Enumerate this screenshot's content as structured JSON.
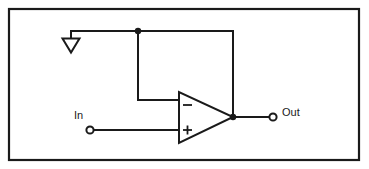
{
  "figure": {
    "kind": "schematic-diagram",
    "background_color": "#ffffff",
    "line_color": "#1a1a1a",
    "frame": {
      "name": "figure-border",
      "x": 8,
      "y": 8,
      "width": 352,
      "height": 153
    }
  },
  "labels": {
    "input": "In",
    "output": "Out"
  },
  "components": {
    "opamp": {
      "name": "operational-amplifier",
      "shape": "triangle",
      "inverting_input_mark": "minus",
      "noninverting_input_mark": "plus",
      "apex_x": 233,
      "apex_y": 117,
      "left_x": 179,
      "top_y": 92,
      "bottom_y": 143
    },
    "ground_arrow": {
      "name": "ground-arrowhead",
      "shape": "open-downward-triangle",
      "tip_x": 71,
      "tip_y": 52
    },
    "input_terminal": {
      "name": "input-terminal-node",
      "cx": 90,
      "cy": 130,
      "r": 3.6
    },
    "output_terminal": {
      "name": "output-terminal-node",
      "cx": 273,
      "cy": 117,
      "r": 3.6
    },
    "junctions": [
      {
        "name": "feedback-top-junction",
        "cx": 138,
        "cy": 31,
        "r": 3.2
      },
      {
        "name": "output-junction",
        "cx": 233,
        "cy": 117,
        "r": 3.2
      }
    ]
  },
  "nets": {
    "top_rail": "from ground arrow stem at x=71 rightwards to x=233 at y=31",
    "feedback_left_branch": "x=138 from y=31 down to y=100 then right to inverting input at x=179",
    "feedback_right_branch": "x=233 from y=31 down to output junction at y=117",
    "input_net": "from input terminal x=94 to noninverting input at x=179, y=130",
    "output_net": "from output junction x=233 to output terminal x=269, y=117"
  }
}
